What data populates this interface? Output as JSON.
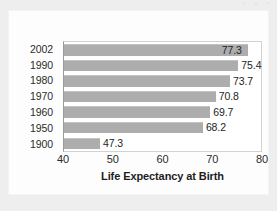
{
  "chart_data": {
    "type": "bar",
    "orientation": "horizontal",
    "title": "",
    "xlabel": "Life Expectancy at Birth",
    "ylabel": "",
    "xlim": [
      40,
      80
    ],
    "xticks": [
      40,
      50,
      60,
      70,
      80
    ],
    "grid": false,
    "legend": false,
    "categories": [
      "2002",
      "1990",
      "1980",
      "1970",
      "1960",
      "1950",
      "1900"
    ],
    "values": [
      77.3,
      75.4,
      73.7,
      70.8,
      69.7,
      68.2,
      47.3
    ],
    "value_labels": [
      "77.3",
      "75.4",
      "73.7",
      "70.8",
      "69.7",
      "68.2",
      "47.3"
    ],
    "label_placement": [
      "inside",
      "outside",
      "outside",
      "outside",
      "outside",
      "outside",
      "outside"
    ],
    "bar_color": "#adadad",
    "text_color": "#242424",
    "plot_background": "#ffffff",
    "page_background": "#efeeee"
  }
}
